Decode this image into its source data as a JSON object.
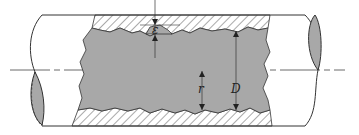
{
  "diagram": {
    "labels": {
      "roughness": "ε",
      "radius": "r",
      "diameter": "D"
    },
    "colors": {
      "fluid": "#a8a8a8",
      "outline": "#333333",
      "hatch": "#555555",
      "background": "#ffffff"
    }
  }
}
